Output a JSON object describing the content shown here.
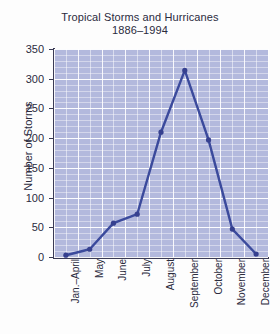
{
  "chart_data": {
    "type": "line",
    "title": "Tropical Storms and Hurricanes",
    "subtitle": "1886–1994",
    "xlabel": "",
    "ylabel": "Number of Storms",
    "categories": [
      "Jan.–April",
      "May",
      "June",
      "July",
      "August",
      "September",
      "October",
      "November",
      "December"
    ],
    "values": [
      3,
      13,
      57,
      72,
      210,
      314,
      197,
      47,
      5
    ],
    "series": [
      {
        "name": "Number of Storms",
        "values": [
          3,
          13,
          57,
          72,
          210,
          314,
          197,
          47,
          5
        ]
      }
    ],
    "ylim": [
      0,
      350
    ],
    "yticks": [
      0,
      50,
      100,
      150,
      200,
      250,
      300,
      350
    ],
    "ytick_labels": [
      "0",
      "50",
      "100",
      "150",
      "200",
      "250",
      "300",
      "350"
    ],
    "grid": true,
    "legend": false,
    "legend_position": "none",
    "line_color": "#3b4a9c",
    "marker_color": "#36408f",
    "plot_background": "#b3b9dd",
    "grid_color": "#ffffff",
    "axis_color": "#3b3b55",
    "text_color": "#2b2b3d"
  }
}
